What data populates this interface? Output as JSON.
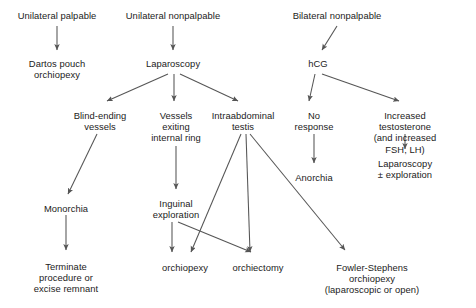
{
  "diagram": {
    "type": "flowchart",
    "orientation": "top-down",
    "colors": {
      "background": "#ffffff",
      "text": "#1b1b1b",
      "edge": "#555555"
    },
    "nodes": [
      {
        "id": "unilateral_palpable",
        "label": "Unilateral palpable",
        "x": 57,
        "y": 10
      },
      {
        "id": "dartos_pouch",
        "label": "Dartos pouch\norchiopexy",
        "x": 57,
        "y": 58
      },
      {
        "id": "unilateral_nonpalpable",
        "label": "Unilateral nonpalpable",
        "x": 173,
        "y": 10
      },
      {
        "id": "laparoscopy",
        "label": "Laparoscopy",
        "x": 173,
        "y": 58
      },
      {
        "id": "blind_ending_vessels",
        "label": "Blind-ending\nvessels",
        "x": 100,
        "y": 110
      },
      {
        "id": "vessels_exiting",
        "label": "Vessels\nexiting\ninternal ring",
        "x": 176,
        "y": 110
      },
      {
        "id": "intraabdominal_testis",
        "label": "Intraabdominal\ntestis",
        "x": 243,
        "y": 110
      },
      {
        "id": "monorchia",
        "label": "Monorchia",
        "x": 66,
        "y": 203
      },
      {
        "id": "terminate_procedure",
        "label": "Terminate\nprocedure or\nexcise remnant",
        "x": 66,
        "y": 261
      },
      {
        "id": "inguinal_exploration",
        "label": "Inguinal\nexploration",
        "x": 176,
        "y": 198
      },
      {
        "id": "orchiopexy",
        "label": "orchiopexy",
        "x": 185,
        "y": 262
      },
      {
        "id": "orchiectomy",
        "label": "orchiectomy",
        "x": 258,
        "y": 262
      },
      {
        "id": "bilateral_nonpalpable",
        "label": "Bilateral nonpalpable",
        "x": 337,
        "y": 10
      },
      {
        "id": "hcg",
        "label": "hCG",
        "x": 318,
        "y": 58
      },
      {
        "id": "no_response",
        "label": "No\nresponse",
        "x": 314,
        "y": 110
      },
      {
        "id": "anorchia",
        "label": "Anorchia",
        "x": 314,
        "y": 172
      },
      {
        "id": "increased_testosterone",
        "label": "Increased testosterone\n(and increased FSH, LH)",
        "x": 405,
        "y": 110
      },
      {
        "id": "laparoscopy_exploration",
        "label": "Laparoscopy\n± exploration",
        "x": 405,
        "y": 158
      },
      {
        "id": "fowler_stephens",
        "label": "Fowler-Stephens orchiopexy\n(laparoscopic or open)",
        "x": 372,
        "y": 262
      }
    ],
    "edges": [
      {
        "from": "unilateral_palpable",
        "to": "dartos_pouch"
      },
      {
        "from": "unilateral_nonpalpable",
        "to": "laparoscopy"
      },
      {
        "from": "laparoscopy",
        "to": "blind_ending_vessels"
      },
      {
        "from": "laparoscopy",
        "to": "vessels_exiting"
      },
      {
        "from": "laparoscopy",
        "to": "intraabdominal_testis"
      },
      {
        "from": "blind_ending_vessels",
        "to": "monorchia"
      },
      {
        "from": "monorchia",
        "to": "terminate_procedure"
      },
      {
        "from": "vessels_exiting",
        "to": "inguinal_exploration"
      },
      {
        "from": "inguinal_exploration",
        "to": "orchiopexy"
      },
      {
        "from": "inguinal_exploration",
        "to": "orchiectomy"
      },
      {
        "from": "intraabdominal_testis",
        "to": "orchiopexy"
      },
      {
        "from": "intraabdominal_testis",
        "to": "orchiectomy"
      },
      {
        "from": "intraabdominal_testis",
        "to": "fowler_stephens"
      },
      {
        "from": "bilateral_nonpalpable",
        "to": "hcg"
      },
      {
        "from": "hcg",
        "to": "no_response"
      },
      {
        "from": "hcg",
        "to": "increased_testosterone"
      },
      {
        "from": "no_response",
        "to": "anorchia"
      },
      {
        "from": "increased_testosterone",
        "to": "laparoscopy_exploration"
      }
    ]
  }
}
